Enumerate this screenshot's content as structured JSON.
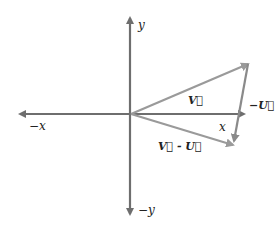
{
  "diagram": {
    "axes": {
      "pos_x_label": "x",
      "neg_x_label": "−x",
      "pos_y_label": "y",
      "neg_y_label": "−y"
    },
    "vectors": {
      "v_label": "V⃗",
      "neg_u_label": "−U⃗",
      "diff_label": "V⃗ - U⃗"
    },
    "colors": {
      "axis": "#6e6e6e",
      "vector": "#9a9a9a",
      "text": "#222222"
    }
  }
}
